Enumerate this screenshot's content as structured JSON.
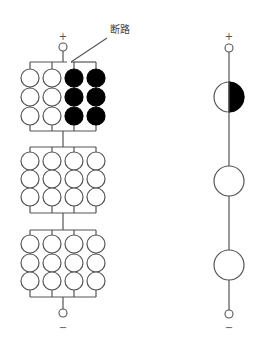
{
  "diagram": {
    "type": "battery-pack-comparison",
    "annotation": {
      "text": "断路"
    },
    "left_pack": {
      "description": "3 series blocks, each 4 parallel strings of 3 cells",
      "positive_terminal": "+",
      "negative_terminal": "−",
      "blocks": [
        {
          "columns": [
            {
              "state": "ok"
            },
            {
              "state": "ok"
            },
            {
              "state": "failed"
            },
            {
              "state": "failed"
            }
          ],
          "note": "open circuit on right two strings"
        },
        {
          "columns": [
            {
              "state": "ok"
            },
            {
              "state": "ok"
            },
            {
              "state": "ok"
            },
            {
              "state": "ok"
            }
          ]
        },
        {
          "columns": [
            {
              "state": "ok"
            },
            {
              "state": "ok"
            },
            {
              "state": "ok"
            },
            {
              "state": "ok"
            }
          ]
        }
      ],
      "cells_per_string": 3
    },
    "right_pack": {
      "description": "equivalent series representation",
      "positive_terminal": "+",
      "negative_terminal": "−",
      "cells": [
        {
          "state": "half-failed"
        },
        {
          "state": "ok"
        },
        {
          "state": "ok"
        }
      ]
    },
    "colors": {
      "wire": "#555555",
      "failed": "#000000",
      "ok": "#ffffff"
    }
  }
}
